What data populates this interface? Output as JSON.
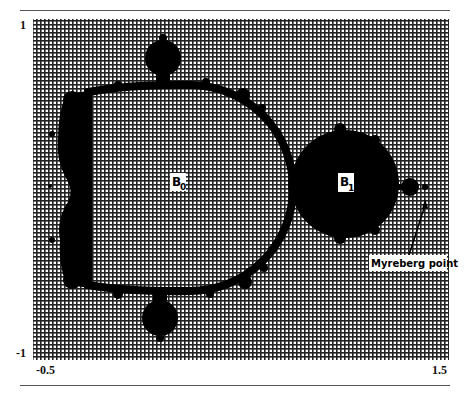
{
  "figure": {
    "type": "mandelbrot-like set diagram on grid background",
    "axes": {
      "y_top_label": "1",
      "y_bottom_label": "-1",
      "x_left_label": "-0.5",
      "x_right_label": "1.5"
    },
    "regions": [
      {
        "id": "B0",
        "label_main": "B",
        "label_sub": "0"
      },
      {
        "id": "B1",
        "label_main": "B",
        "label_sub": "1"
      }
    ],
    "annotation": {
      "label": "Myreberg point"
    },
    "colors": {
      "set_fill": "#000000",
      "grid_line": "#222222",
      "background": "#ffffff",
      "rule": "#555555"
    }
  }
}
